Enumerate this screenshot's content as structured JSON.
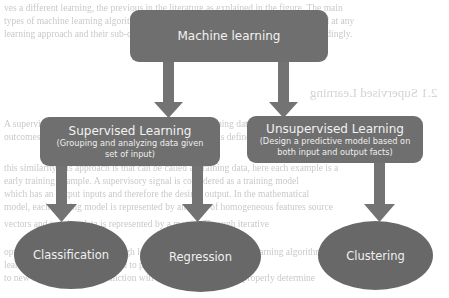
{
  "diagram": {
    "root": {
      "label": "Machine learning"
    },
    "branches": [
      {
        "title": "Supervised Learning",
        "description": "(Grouping and analyzing data given set of input)",
        "desc_line1": "(Grouping and analyzing data given",
        "desc_line2": "set of input)",
        "children": [
          {
            "label": "Classification"
          },
          {
            "label": "Regression"
          }
        ]
      },
      {
        "title": "Unsupervised Learning",
        "description": "(Design a predictive model based on both input and output facts)",
        "desc_line1": "(Design a predictive model based on",
        "desc_line2": "both input and output facts)",
        "children": [
          {
            "label": "Clustering"
          }
        ]
      }
    ],
    "colors": {
      "box_fill": "#6f6f6f",
      "ellipse_fill": "#686868",
      "arrow_fill": "#737373",
      "text": "#f2f2f2",
      "background_text": "#c9c9c9"
    }
  },
  "background_document": {
    "section_heading_mirrored": "2.1 Supervised Learning",
    "lines": [
      "ves a different learning, the previous in the literature as explained in the figure. The main",
      "types of machine learning algorithms are listed and examined for accuracy below and at any",
      "learning approach and their sub-categories are clearly and accurately classified accordingly.",
      "A supervised learning algorithm learns from labeled training data and helps to predict",
      "outcomes for unforeseen data. The supervised approach is defined by the way the machine",
      "this similarity this approach is that can be called as training data, here each example is a",
      "early training example. A supervisory signal is considered as a training model",
      "which has an output inputs and therefore the desired output. In the mathematical",
      "model, each training model is represented by an array of homogeneous features source",
      "vectors and training data is represented by a matrix. Through iterative",
      "optimization of a function through loop optimization, supervised learning algorithms",
      "learn a function that can be used to predict the output associated",
      "to new inputs. An optimal function will allow the algorithm to properly determine"
    ]
  }
}
